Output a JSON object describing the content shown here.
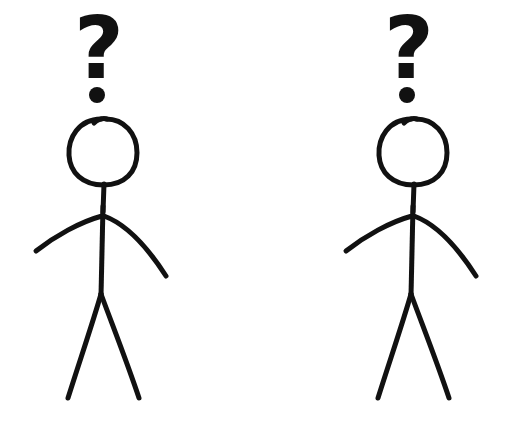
{
  "canvas": {
    "width": 512,
    "height": 424,
    "background_color": "#ffffff",
    "ink_color": "#111111"
  },
  "scene": {
    "description": "Two identical hand-drawn stick figures standing side by side, each with a large bold question mark floating above its head",
    "figure_count": 2
  },
  "figures": [
    {
      "id": "left",
      "label": "Left confused stick figure",
      "center_x": 103,
      "question_mark": {
        "text": "?",
        "x": 99,
        "y": 78,
        "font_size": 86,
        "dot_cx": 97,
        "dot_cy": 95,
        "dot_r": 8
      },
      "head": {
        "cx": 103,
        "cy": 152,
        "rx": 34,
        "ry": 33,
        "stroke_width": 5
      },
      "neck": {
        "x1": 104,
        "y1": 184,
        "x2": 103,
        "y2": 212,
        "stroke_width": 5
      },
      "torso": {
        "x1": 103,
        "y1": 206,
        "x2": 101,
        "y2": 296,
        "stroke_width": 5
      },
      "arm_left": {
        "path": "M 102 216 C 80 222 55 236 36 251",
        "stroke_width": 5
      },
      "arm_right": {
        "path": "M 104 216 C 126 224 148 248 166 276",
        "stroke_width": 5
      },
      "leg_left": {
        "path": "M 101 294 C 93 322 80 360 68 398",
        "stroke_width": 5
      },
      "leg_right": {
        "path": "M 101 294 C 112 324 127 362 139 398",
        "stroke_width": 5
      }
    },
    {
      "id": "right",
      "label": "Right confused stick figure",
      "center_x": 413,
      "question_mark": {
        "text": "?",
        "x": 409,
        "y": 78,
        "font_size": 86,
        "dot_cx": 407,
        "dot_cy": 95,
        "dot_r": 8
      },
      "head": {
        "cx": 413,
        "cy": 152,
        "rx": 34,
        "ry": 33,
        "stroke_width": 5
      },
      "neck": {
        "x1": 414,
        "y1": 184,
        "x2": 413,
        "y2": 212,
        "stroke_width": 5
      },
      "torso": {
        "x1": 413,
        "y1": 206,
        "x2": 411,
        "y2": 296,
        "stroke_width": 5
      },
      "arm_left": {
        "path": "M 412 216 C 390 222 365 236 346 251",
        "stroke_width": 5
      },
      "arm_right": {
        "path": "M 414 216 C 436 224 458 248 476 276",
        "stroke_width": 5
      },
      "leg_left": {
        "path": "M 411 294 C 403 322 390 360 378 398",
        "stroke_width": 5
      },
      "leg_right": {
        "path": "M 411 294 C 422 324 437 362 449 398",
        "stroke_width": 5
      }
    }
  ]
}
